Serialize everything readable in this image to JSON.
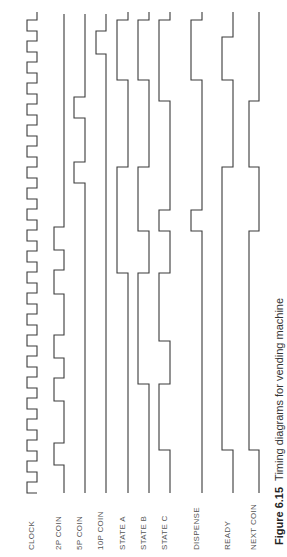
{
  "figure": {
    "number": "Figure 6.15",
    "caption": "Timing diagrams for vending machine"
  },
  "signals": [
    {
      "name": "CLOCK",
      "x_low": 27,
      "x_high": 37
    },
    {
      "name": "2P COIN",
      "x_low": 54,
      "x_high": 64
    },
    {
      "name": "5P COIN",
      "x_low": 74,
      "x_high": 85
    },
    {
      "name": "10P COIN",
      "x_low": 96,
      "x_high": 106
    },
    {
      "name": "STATE A",
      "x_low": 117,
      "x_high": 128
    },
    {
      "name": "STATE B",
      "x_low": 138,
      "x_high": 149
    },
    {
      "name": "STATE C",
      "x_low": 159,
      "x_high": 170
    },
    {
      "name": "DISPENSE",
      "x_low": 191,
      "x_high": 202
    },
    {
      "name": "READY",
      "x_low": 222,
      "x_high": 233
    },
    {
      "name": "NEXT COIN",
      "x_low": 249,
      "x_high": 259
    }
  ],
  "chart_data": {
    "type": "timing",
    "title": "Timing diagrams for vending machine",
    "orientation": "rotated-90 (time runs bottom to top)",
    "signals": [
      "CLOCK",
      "2P COIN",
      "5P COIN",
      "10P COIN",
      "STATE A",
      "STATE B",
      "STATE C",
      "DISPENSE",
      "READY",
      "NEXT COIN"
    ],
    "clock_cycles": 24
  }
}
